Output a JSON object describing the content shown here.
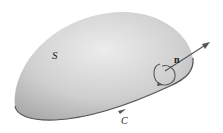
{
  "figure": {
    "surface_label": "S",
    "normal_label": "n",
    "curve_label": "C",
    "colors": {
      "surface_light": "#e6e6e6",
      "surface_dark": "#a8a8a8",
      "edge": "#555555",
      "arrow": "#555555",
      "text": "#222222"
    }
  }
}
